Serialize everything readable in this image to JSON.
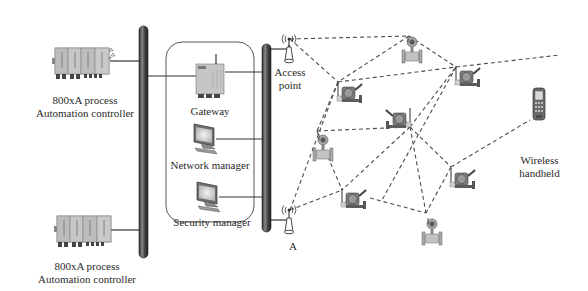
{
  "diagram": {
    "title": "",
    "labels": {
      "controller_top": [
        "800xA process",
        "Automation controller"
      ],
      "controller_bottom": [
        "800xA process",
        "Automation controller"
      ],
      "gateway": "Gateway",
      "network_manager": "Network manager",
      "security_manager": "Security manager",
      "access_point_top": [
        "Access",
        "point"
      ],
      "access_point_bottom": "Access point",
      "wireless_handheld": [
        "Wireless",
        "handheld"
      ]
    },
    "nodes": [
      {
        "id": "ctrl_top",
        "type": "controller",
        "label": "800xA process Automation controller",
        "x": 75,
        "y": 62
      },
      {
        "id": "ctrl_bottom",
        "type": "controller",
        "label": "800xA process Automation controller",
        "x": 80,
        "y": 224
      },
      {
        "id": "backbone_left",
        "type": "bus",
        "x": 144,
        "y1": 28,
        "y2": 257
      },
      {
        "id": "backbone_right",
        "type": "bus",
        "x": 267,
        "y1": 46,
        "y2": 230
      },
      {
        "id": "gateway",
        "type": "gateway",
        "label": "Gateway",
        "x": 210,
        "y": 68
      },
      {
        "id": "network_manager",
        "type": "workstation",
        "label": "Network manager",
        "x": 205,
        "y": 138
      },
      {
        "id": "security_manager",
        "type": "workstation",
        "label": "Security manager",
        "x": 208,
        "y": 196
      },
      {
        "id": "ap_top",
        "type": "access_point",
        "label": "Access point",
        "x": 289,
        "y": 40
      },
      {
        "id": "ap_bottom",
        "type": "access_point",
        "label": "Access point",
        "x": 289,
        "y": 216
      },
      {
        "id": "f1",
        "type": "flowmeter",
        "x": 409,
        "y": 50
      },
      {
        "id": "t1",
        "type": "transmitter",
        "x": 348,
        "y": 90
      },
      {
        "id": "t2",
        "type": "transmitter",
        "x": 402,
        "y": 120
      },
      {
        "id": "t3",
        "type": "transmitter",
        "x": 468,
        "y": 78
      },
      {
        "id": "f2",
        "type": "flowmeter",
        "x": 323,
        "y": 148
      },
      {
        "id": "t4",
        "type": "transmitter",
        "x": 352,
        "y": 196
      },
      {
        "id": "t5",
        "type": "transmitter",
        "x": 461,
        "y": 178
      },
      {
        "id": "f3",
        "type": "flowmeter",
        "x": 432,
        "y": 232
      },
      {
        "id": "handheld",
        "type": "handheld",
        "label": "Wireless handheld",
        "x": 538,
        "y": 102
      }
    ],
    "wireless_links": [
      [
        "ap_top",
        "f1"
      ],
      [
        "ap_top",
        "t1"
      ],
      [
        "f1",
        "t1"
      ],
      [
        "f1",
        "t3"
      ],
      [
        "t1",
        "t3"
      ],
      [
        "t1",
        "f2"
      ],
      [
        "f2",
        "t2"
      ],
      [
        "t2",
        "t4"
      ],
      [
        "t2",
        "f3"
      ],
      [
        "t2",
        "t3"
      ],
      [
        "t3",
        "t5"
      ],
      [
        "f2",
        "t4"
      ],
      [
        "ap_bottom",
        "t4"
      ],
      [
        "ap_bottom",
        "t1"
      ],
      [
        "t4",
        "f3"
      ],
      [
        "t5",
        "f3"
      ],
      [
        "t5",
        "handheld"
      ],
      [
        "t5",
        "t2"
      ]
    ],
    "colors": {
      "bus": "#4a4a4a",
      "line": "#333333",
      "dash": "#555555",
      "device": "#b9b9b9",
      "device_dark": "#5a5a5a",
      "text": "#2a2a2a"
    }
  }
}
